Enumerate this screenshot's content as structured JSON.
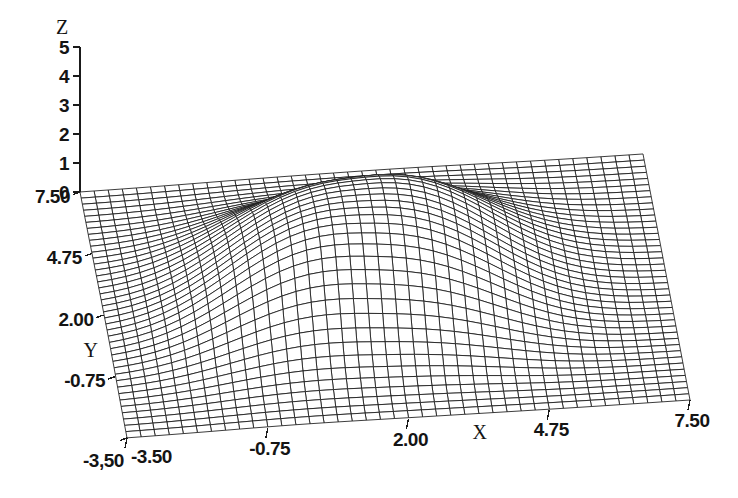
{
  "figure": {
    "kind": "3d-wireframe-surface",
    "background_color": "#ffffff",
    "line_color": "#1a1a1a",
    "face_color": "#ffffff"
  },
  "axes": {
    "z": {
      "name": "Z",
      "ticks": [
        "5",
        "4",
        "3",
        "2",
        "1",
        "0"
      ],
      "tick_values": [
        5,
        4,
        3,
        2,
        1,
        0
      ],
      "range": [
        0,
        5
      ]
    },
    "y": {
      "name": "Y",
      "ticks": [
        "7.50",
        "4.75",
        "2.00",
        "-0.75",
        "-3,50"
      ],
      "tick_values": [
        7.5,
        4.75,
        2.0,
        -0.75,
        -3.5
      ],
      "range": [
        -3.5,
        7.5
      ]
    },
    "x": {
      "name": "X",
      "ticks": [
        "-3.50",
        "-0.75",
        "2.00",
        "4.75",
        "7.50"
      ],
      "tick_values": [
        -3.5,
        -0.75,
        2.0,
        4.75,
        7.5
      ],
      "range": [
        -3.5,
        7.5
      ]
    }
  },
  "chart_data": {
    "type": "surface",
    "title": "",
    "xlabel": "X",
    "ylabel": "Y",
    "zlabel": "Z",
    "xlim": [
      -3.5,
      7.5
    ],
    "ylim": [
      -3.5,
      7.5
    ],
    "zlim": [
      0,
      5
    ],
    "xticks": [
      -3.5,
      -0.75,
      2.0,
      4.75,
      7.5
    ],
    "yticks": [
      -3.5,
      -0.75,
      2.0,
      4.75,
      7.5
    ],
    "zticks": [
      0,
      1,
      2,
      3,
      4,
      5
    ],
    "grid": false,
    "legend": "none",
    "mesh_nx": 40,
    "mesh_ny": 40,
    "peak_value": 3.15,
    "peak_x": 1.6,
    "peak_y": 2.0,
    "surface_model": {
      "base": 0.0,
      "bumps": [
        {
          "amp": 3.12,
          "cx": 1.55,
          "cy": 2.15,
          "sx": 3.05,
          "sy": 3.15,
          "power": 2.6
        },
        {
          "amp": 0.42,
          "cx": -0.3,
          "cy": 0.2,
          "sx": 2.2,
          "sy": 2.4,
          "power": 2.0
        },
        {
          "amp": 0.3,
          "cx": 3.4,
          "cy": 3.6,
          "sx": 2.3,
          "sy": 2.2,
          "power": 2.0
        }
      ]
    },
    "sampled_grid": {
      "x": [
        -3.5,
        -2.4,
        -1.3,
        -0.2,
        0.9,
        2.0,
        3.1,
        4.2,
        5.3,
        6.4,
        7.5
      ],
      "y": [
        -3.5,
        -2.4,
        -1.3,
        -0.2,
        0.9,
        2.0,
        3.1,
        4.2,
        5.3,
        6.4,
        7.5
      ],
      "z": [
        [
          0.0,
          0.0,
          0.01,
          0.01,
          0.02,
          0.02,
          0.02,
          0.01,
          0.01,
          0.0,
          0.0
        ],
        [
          0.0,
          0.02,
          0.06,
          0.13,
          0.2,
          0.24,
          0.22,
          0.14,
          0.06,
          0.02,
          0.0
        ],
        [
          0.01,
          0.06,
          0.22,
          0.52,
          0.84,
          1.0,
          0.92,
          0.59,
          0.25,
          0.07,
          0.01
        ],
        [
          0.01,
          0.13,
          0.52,
          1.28,
          2.07,
          2.47,
          2.28,
          1.46,
          0.61,
          0.16,
          0.02
        ],
        [
          0.02,
          0.2,
          0.84,
          2.07,
          2.92,
          3.06,
          2.96,
          2.18,
          0.98,
          0.26,
          0.03
        ],
        [
          0.02,
          0.24,
          1.0,
          2.47,
          3.06,
          3.12,
          3.07,
          2.55,
          1.18,
          0.32,
          0.04
        ],
        [
          0.02,
          0.22,
          0.92,
          2.28,
          2.96,
          3.07,
          2.88,
          2.16,
          1.06,
          0.29,
          0.03
        ],
        [
          0.01,
          0.14,
          0.59,
          1.46,
          2.18,
          2.55,
          2.16,
          1.34,
          0.58,
          0.16,
          0.02
        ],
        [
          0.01,
          0.06,
          0.25,
          0.61,
          0.98,
          1.18,
          1.06,
          0.58,
          0.23,
          0.06,
          0.01
        ],
        [
          0.0,
          0.02,
          0.07,
          0.16,
          0.26,
          0.32,
          0.29,
          0.16,
          0.06,
          0.02,
          0.0
        ],
        [
          0.0,
          0.0,
          0.01,
          0.02,
          0.03,
          0.04,
          0.03,
          0.02,
          0.01,
          0.0,
          0.0
        ]
      ]
    }
  },
  "labels": {
    "z_axis_name": "Z",
    "z_5": "5",
    "z_4": "4",
    "z_3": "3",
    "z_2": "2",
    "z_1": "1",
    "z_0": "0",
    "y_axis_name": "Y",
    "y_750": "7.50",
    "y_475": "4.75",
    "y_200": "2.00",
    "y_n075": "-0.75",
    "y_n350": "-3,50",
    "x_axis_name": "X",
    "x_n350": "-3.50",
    "x_n075": "-0.75",
    "x_200": "2.00",
    "x_475": "4.75",
    "x_750": "7.50"
  }
}
